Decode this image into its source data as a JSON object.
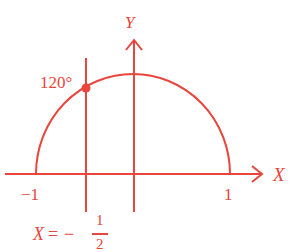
{
  "diagram": {
    "color": "#e8453c",
    "axes": {
      "x_label": "X",
      "y_label": "Y"
    },
    "ticks": {
      "neg_one": "−1",
      "one": "1"
    },
    "point_label": "120°",
    "line_label": {
      "lhs": "X",
      "eq": "=",
      "minus": "−",
      "num": "1",
      "den": "2"
    }
  }
}
